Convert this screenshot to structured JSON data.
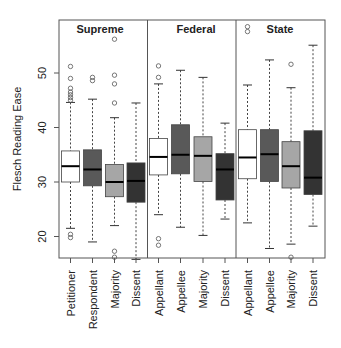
{
  "chart_data": {
    "type": "boxplot",
    "title": "",
    "xlabel": "",
    "ylabel": "Flesch Reading Ease",
    "ylim": [
      14,
      58
    ],
    "yticks": [
      20,
      30,
      40,
      50
    ],
    "grid": false,
    "legend": null,
    "panels": [
      {
        "name": "Supreme",
        "groups": [
          {
            "label": "Petitioner",
            "fill": "#ffffff",
            "whisker_low": 21.5,
            "q1": 30.0,
            "median": 32.9,
            "q3": 35.7,
            "whisker_high": 44.6,
            "outliers": [
              19.8,
              20.4,
              45.0,
              45.5,
              46.0,
              46.5,
              47.2,
              49.0,
              51.2
            ]
          },
          {
            "label": "Respondent",
            "fill": "#595959",
            "whisker_low": 19.0,
            "q1": 29.3,
            "median": 32.3,
            "q3": 35.9,
            "whisker_high": 45.2,
            "outliers": [
              48.6,
              49.2
            ]
          },
          {
            "label": "Majority",
            "fill": "#a6a6a6",
            "whisker_low": 22.0,
            "q1": 27.3,
            "median": 30.0,
            "q3": 33.2,
            "whisker_high": 41.8,
            "outliers": [
              16.2,
              17.3,
              44.5,
              48.0,
              49.6,
              56.2
            ]
          },
          {
            "label": "Dissent",
            "fill": "#333333",
            "whisker_low": 15.8,
            "q1": 26.3,
            "median": 30.2,
            "q3": 33.5,
            "whisker_high": 44.5,
            "outliers": []
          }
        ]
      },
      {
        "name": "Federal",
        "groups": [
          {
            "label": "Appellant",
            "fill": "#ffffff",
            "whisker_low": 24.0,
            "q1": 31.3,
            "median": 34.6,
            "q3": 38.0,
            "whisker_high": 48.0,
            "outliers": [
              18.4,
              19.6,
              49.2,
              51.3
            ]
          },
          {
            "label": "Appellee",
            "fill": "#595959",
            "whisker_low": 21.7,
            "q1": 31.5,
            "median": 35.0,
            "q3": 40.5,
            "whisker_high": 50.5,
            "outliers": []
          },
          {
            "label": "Majority",
            "fill": "#a6a6a6",
            "whisker_low": 20.2,
            "q1": 30.1,
            "median": 34.8,
            "q3": 38.3,
            "whisker_high": 49.2,
            "outliers": []
          },
          {
            "label": "Dissent",
            "fill": "#333333",
            "whisker_low": 23.2,
            "q1": 26.7,
            "median": 32.3,
            "q3": 35.2,
            "whisker_high": 40.8,
            "outliers": []
          }
        ]
      },
      {
        "name": "State",
        "groups": [
          {
            "label": "Appellant",
            "fill": "#ffffff",
            "whisker_low": 22.5,
            "q1": 30.6,
            "median": 34.5,
            "q3": 39.6,
            "whisker_high": 47.8,
            "outliers": [
              57.6,
              58.5
            ]
          },
          {
            "label": "Appellee",
            "fill": "#595959",
            "whisker_low": 17.8,
            "q1": 30.1,
            "median": 35.1,
            "q3": 39.6,
            "whisker_high": 52.4,
            "outliers": []
          },
          {
            "label": "Majority",
            "fill": "#a6a6a6",
            "whisker_low": 18.6,
            "q1": 28.9,
            "median": 32.9,
            "q3": 37.4,
            "whisker_high": 47.3,
            "outliers": [
              16.2,
              51.6
            ]
          },
          {
            "label": "Dissent",
            "fill": "#333333",
            "whisker_low": 21.9,
            "q1": 27.7,
            "median": 30.8,
            "q3": 39.4,
            "whisker_high": 55.1,
            "outliers": []
          }
        ]
      }
    ]
  }
}
